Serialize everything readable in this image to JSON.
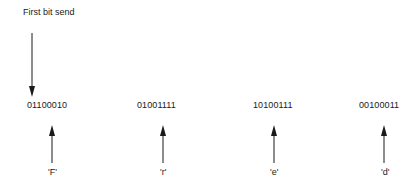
{
  "diagram": {
    "title": "First bit send",
    "first_bit_arrow": {
      "x": 32,
      "y1": 33,
      "y2": 97,
      "direction": "down"
    },
    "bytes": [
      {
        "bits": "01100010",
        "char": "'F'",
        "text_x": 27,
        "arrow_x": 52,
        "label_x": 48
      },
      {
        "bits": "01001111",
        "char": "'r'",
        "text_x": 137,
        "arrow_x": 163,
        "label_x": 160
      },
      {
        "bits": "10100111",
        "char": "'e'",
        "text_x": 253,
        "arrow_x": 274,
        "label_x": 270
      },
      {
        "bits": "00100011",
        "char": "'d'",
        "text_x": 359,
        "arrow_x": 384,
        "label_x": 381
      }
    ],
    "colors": {
      "line": "#1a1a1a",
      "background": "#ffffff"
    }
  }
}
